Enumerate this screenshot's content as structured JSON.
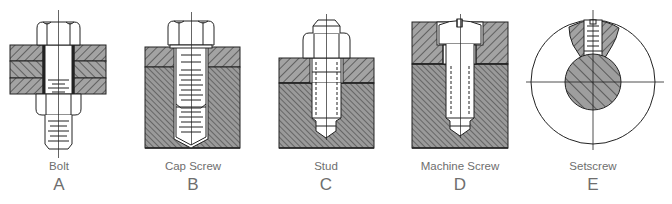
{
  "figure": {
    "fasteners": [
      {
        "name": "Bolt",
        "letter": "A"
      },
      {
        "name": "Cap Screw",
        "letter": "B"
      },
      {
        "name": "Stud",
        "letter": "C"
      },
      {
        "name": "Machine Screw",
        "letter": "D"
      },
      {
        "name": "Setscrew",
        "letter": "E"
      }
    ],
    "colors": {
      "line": "#222222",
      "hatch_fill": "#9a9a9a",
      "label": "#6e6e6e",
      "background": "#ffffff"
    }
  }
}
